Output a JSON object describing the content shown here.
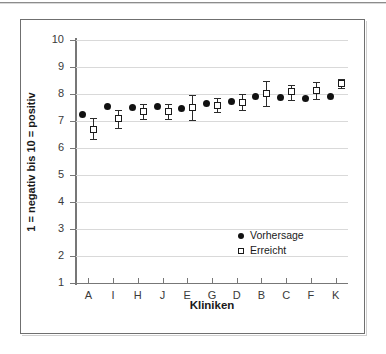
{
  "chart_data": {
    "type": "scatter",
    "title": "",
    "xlabel": "Kliniken",
    "ylabel": "1 = negativ bis 10 = positiv",
    "categories": [
      "A",
      "I",
      "H",
      "J",
      "E",
      "G",
      "D",
      "B",
      "C",
      "F",
      "K"
    ],
    "ylim": [
      1,
      10
    ],
    "yticks": [
      1,
      2,
      3,
      4,
      5,
      6,
      7,
      8,
      9,
      10
    ],
    "grid": true,
    "legend_position": "inside-right-lower",
    "series": [
      {
        "name": "Vorhersage",
        "marker": "filled-circle",
        "color": "#111111",
        "values": [
          7.25,
          7.52,
          7.51,
          7.55,
          7.47,
          7.63,
          7.72,
          7.91,
          7.88,
          7.82,
          7.89
        ],
        "errors_low": [
          null,
          null,
          null,
          null,
          null,
          null,
          null,
          null,
          null,
          null,
          null
        ],
        "errors_high": [
          null,
          null,
          null,
          null,
          null,
          null,
          null,
          null,
          null,
          null,
          null
        ]
      },
      {
        "name": "Erreicht",
        "marker": "open-square",
        "color": "#1a1a1a",
        "values": [
          6.7,
          7.08,
          7.35,
          7.37,
          7.5,
          7.58,
          7.7,
          8.01,
          8.08,
          8.12,
          8.4
        ],
        "errors_low": [
          6.33,
          6.74,
          7.08,
          7.09,
          7.03,
          7.32,
          7.42,
          7.55,
          7.77,
          7.83,
          8.23
        ],
        "errors_high": [
          7.1,
          7.42,
          7.62,
          7.64,
          7.97,
          7.86,
          7.99,
          8.47,
          8.34,
          8.44,
          8.57
        ]
      }
    ]
  },
  "legend": {
    "items": [
      {
        "label": "Vorhersage",
        "marker": "filled-circle"
      },
      {
        "label": "Erreicht",
        "marker": "open-square"
      }
    ]
  }
}
